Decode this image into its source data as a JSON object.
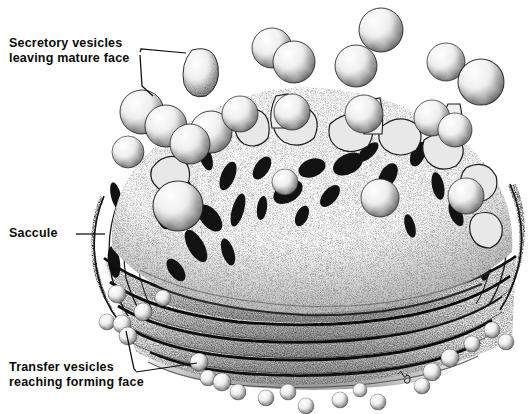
{
  "figure": {
    "style": "stipple-ink-drawing",
    "background_color": "#ffffff",
    "ink_color": "#111111"
  },
  "labels": {
    "secretory": {
      "line1": "Secretory  vesicles",
      "line2": "leaving  mature  face"
    },
    "saccule": {
      "line1": "Saccule"
    },
    "transfer": {
      "line1": "Transfer  vesicles",
      "line2": "reaching  forming  face"
    }
  },
  "signature": {
    "text": "artist-signature-mark"
  },
  "leaders": {
    "secretory": {
      "branch_up": "M 140 52 L 141 49 L 186 52",
      "branch_down": "M 140 55 L 141 86 L 152 95"
    },
    "saccule": {
      "line": "M 78 234 L 104 234"
    },
    "transfer": {
      "branch_up": "M 136 371 L 134 370 L 126 330",
      "branch_right": "M 136 372 L 198 362"
    }
  },
  "structures": {
    "dome": {
      "name": "mature-face-dome",
      "description": "stippled convex cisternal surface with fenestrations"
    },
    "stack": {
      "name": "saccule-stack",
      "layers": 6,
      "description": "flattened stacked cisternae with dark membrane edges"
    },
    "secretory_vesicles": {
      "count": 18,
      "description": "large budding and free spheres along mature face"
    },
    "transfer_vesicles": {
      "count": 22,
      "description": "small spheres near forming face at base"
    }
  }
}
